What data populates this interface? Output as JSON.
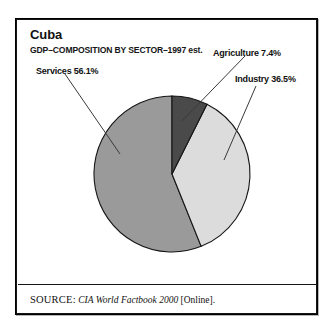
{
  "figure": {
    "title": "Cuba",
    "subtitle": "GDP–COMPOSITION BY SECTOR–1997 est.",
    "source": {
      "label": "SOURCE:",
      "title": "CIA World Factbook 2000",
      "suffix": " [Online]."
    }
  },
  "labels": {
    "services": "Services 56.1%",
    "agriculture": "Agriculture 7.4%",
    "industry": "Industry 36.5%"
  },
  "colors": {
    "agriculture": "#4a4a4a",
    "industry": "#dcdcdc",
    "services": "#9a9a9a",
    "outline": "#151515",
    "leader_line": "#3a3a3a",
    "frame": "#000000",
    "background": "#ffffff"
  },
  "chart_data": {
    "type": "pie",
    "title": "Cuba",
    "subtitle": "GDP–COMPOSITION BY SECTOR–1997 est.",
    "xlabel": "",
    "ylabel": "",
    "unit": "percent",
    "total": 100.0,
    "start_angle_deg": 0,
    "direction": "clockwise",
    "legend_position": "callout-labels",
    "grid": false,
    "categories": [
      "Agriculture",
      "Industry",
      "Services"
    ],
    "values": [
      7.4,
      36.5,
      56.1
    ],
    "slices": [
      {
        "label": "Agriculture",
        "value": 7.4,
        "display": "Agriculture 7.4%",
        "color": "#4a4a4a",
        "start_angle_deg": 0.0,
        "end_angle_deg": 26.64
      },
      {
        "label": "Industry",
        "value": 36.5,
        "display": "Industry 36.5%",
        "color": "#dcdcdc",
        "start_angle_deg": 26.64,
        "end_angle_deg": 158.04
      },
      {
        "label": "Services",
        "value": 56.1,
        "display": "Services 56.1%",
        "color": "#9a9a9a",
        "start_angle_deg": 158.04,
        "end_angle_deg": 360.0
      }
    ],
    "annotations": [
      "SOURCE: CIA World Factbook 2000 [Online]."
    ]
  }
}
